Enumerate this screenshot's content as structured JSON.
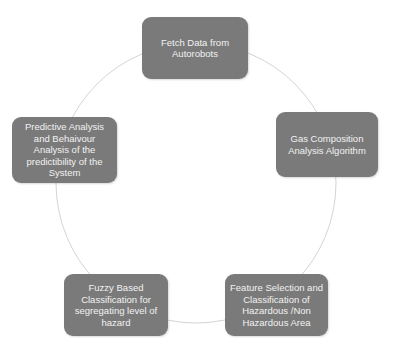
{
  "diagram": {
    "type": "cycle",
    "colors": {
      "node_fill": "#7a7a7a",
      "node_text": "#f2f2f2",
      "ring": "#d4d4d4",
      "background": "#ffffff"
    },
    "nodes": [
      {
        "id": "fetch",
        "label": "Fetch Data from Autorobots"
      },
      {
        "id": "gas",
        "label": "Gas Composition Analysis Algorithm"
      },
      {
        "id": "feature",
        "label": "Feature Selection and Classification of Hazardous /Non Hazardous Area"
      },
      {
        "id": "fuzzy",
        "label": "Fuzzy Based Classification  for segregating level of hazard"
      },
      {
        "id": "predict",
        "label": "Predictive Analysis  and Behaivour Analysis  of the predictibility  of the System"
      }
    ]
  }
}
